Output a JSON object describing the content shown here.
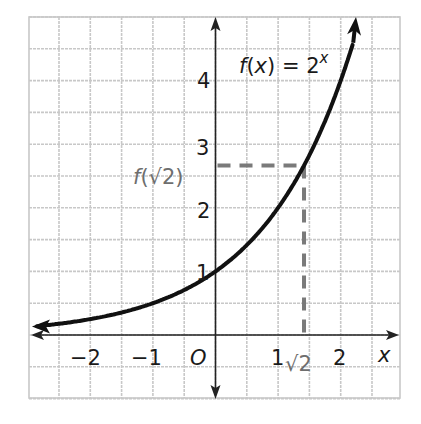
{
  "chart_data": {
    "type": "line",
    "title": "",
    "function_label": "f(x) = 2^x",
    "function_label_parts": {
      "name": "f(x) = 2",
      "exponent": "x"
    },
    "xlabel": "x",
    "ylabel": "",
    "origin_label": "O",
    "xlim": [
      -2.9,
      3.0
    ],
    "ylim": [
      -1.0,
      5.0
    ],
    "grid": true,
    "grid_step": 0.5,
    "x_ticks": [
      {
        "value": -2,
        "label": "−2"
      },
      {
        "value": -1,
        "label": "−1"
      },
      {
        "value": 1,
        "label": "1"
      },
      {
        "value": 2,
        "label": "2"
      }
    ],
    "y_ticks": [
      {
        "value": 1,
        "label": "1"
      },
      {
        "value": 2,
        "label": "2"
      },
      {
        "value": 3,
        "label": "3"
      },
      {
        "value": 4,
        "label": "4"
      }
    ],
    "series": [
      {
        "name": "f(x) = 2^x",
        "x": [
          -2.9,
          -2.5,
          -2,
          -1.5,
          -1,
          -0.5,
          0,
          0.5,
          1,
          1.414,
          1.5,
          2,
          2.25
        ],
        "y": [
          0.134,
          0.177,
          0.25,
          0.354,
          0.5,
          0.707,
          1,
          1.414,
          2,
          2.665,
          2.828,
          4,
          4.757
        ],
        "color": "#111111"
      }
    ],
    "annotations": [
      {
        "type": "dashed-vertical",
        "x": 1.414,
        "from_y": 0,
        "to_y": 2.665,
        "label": "√2",
        "color": "#7a7a7a"
      },
      {
        "type": "dashed-horizontal",
        "y": 2.665,
        "from_x": 0,
        "to_x": 1.414,
        "label": "f(√2)",
        "color": "#7a7a7a"
      }
    ],
    "colors": {
      "grid": "#c8c8c8",
      "axis": "#222222",
      "curve": "#111111",
      "annotation": "#7a7a7a"
    }
  }
}
